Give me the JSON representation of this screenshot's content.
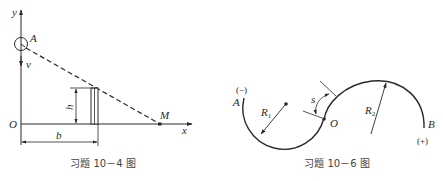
{
  "colors": {
    "ink": "#2a2a2a",
    "caption": "#444444",
    "background": "#ffffff"
  },
  "figure_left": {
    "caption": "习题 10－4 图",
    "labels": {
      "y_axis": "y",
      "x_axis": "x",
      "origin": "O",
      "point_a": "A",
      "point_m": "M",
      "velocity": "v",
      "height": "h",
      "distance": "b"
    }
  },
  "figure_right": {
    "caption": "习题 10－6 图",
    "labels": {
      "point_a": "A",
      "point_b": "B",
      "origin": "O",
      "negative_sign": "(−)",
      "positive_sign": "(+)",
      "arc_length": "s",
      "radius1_main": "R",
      "radius1_sub": "1",
      "radius2_main": "R",
      "radius2_sub": "2"
    }
  }
}
